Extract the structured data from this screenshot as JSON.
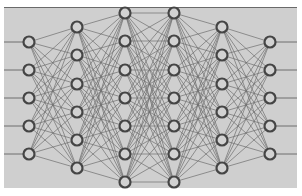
{
  "diagram": {
    "type": "neural-network",
    "colors": {
      "background": "#ffffff",
      "panel": "#cfcfcf",
      "panel_top_border": "#6a6a6a",
      "edge": "#6e6e6e",
      "node_stroke": "#454545",
      "node_fill": "#d2d2d2"
    },
    "panel": {
      "x": 4,
      "y": 7,
      "width": 293,
      "height": 181
    },
    "node_radius": 5.5,
    "layers": [
      {
        "name": "input-layer",
        "x": 29,
        "nodes": [
          42,
          70,
          98,
          126,
          154
        ]
      },
      {
        "name": "hidden-layer-1",
        "x": 77,
        "nodes": [
          27,
          55,
          84,
          112,
          140,
          168
        ]
      },
      {
        "name": "hidden-layer-2",
        "x": 125,
        "nodes": [
          13,
          41,
          70,
          98,
          126,
          154,
          182
        ]
      },
      {
        "name": "hidden-layer-3",
        "x": 174,
        "nodes": [
          13,
          41,
          70,
          98,
          126,
          154,
          182
        ]
      },
      {
        "name": "hidden-layer-4",
        "x": 222,
        "nodes": [
          27,
          55,
          84,
          112,
          140,
          168
        ]
      },
      {
        "name": "output-layer",
        "x": 270,
        "nodes": [
          42,
          70,
          98,
          126,
          154
        ]
      }
    ],
    "input_line_start_x": 4,
    "output_line_end_x": 297
  }
}
